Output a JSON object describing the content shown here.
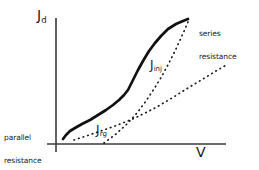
{
  "figure": {
    "kind": "schematic-jv-curve",
    "background_color": "#ffffff",
    "ink_color": "#1a1a1a"
  },
  "axes": {
    "y_label_main": "J",
    "y_label_sub": "d",
    "x_label": "V",
    "y_axis": {
      "x": 56,
      "y_top": 18,
      "y_bottom": 152
    },
    "x_axis": {
      "y": 144,
      "x_left": 47,
      "x_right": 226
    }
  },
  "annotations": {
    "parallel_resistance_line1": "parallel",
    "parallel_resistance_line2": "resistance",
    "series_resistance_line1": "series",
    "series_resistance_line2": "resistance"
  },
  "curves": {
    "solid_total": {
      "style": "solid",
      "width": 2.6,
      "label": "",
      "points": "63,139 66,135 70,131 75,128 82,124 90,120 98,115 106,110 113,105 119,100 124,95 128,90 131,84 134,78 138,70 143,61 149,51 155,43 161,36 168,29 176,24 183,21 188,19"
    },
    "dotted_jrg": {
      "style": "dotted",
      "label_main": "J",
      "label_sub": "rg",
      "width": 1.6,
      "points": "74,140 95,133 115,126 135,118 155,108 172,98 188,88 203,79 216,71 228,64"
    },
    "dotted_jinj": {
      "style": "dotted",
      "label_main": "J",
      "label_sub": "inj",
      "width": 1.6,
      "points": "104,143 116,134 127,124 137,113 146,101 154,89 162,76 169,63 175,51 180,40 185,29 188,22"
    }
  },
  "chart_data": {
    "type": "line",
    "title": "",
    "xlabel": "V",
    "ylabel": "Jd",
    "grid": false,
    "legend": "inline-annotations",
    "series": [
      {
        "name": "Jd (total dark current)",
        "style": "solid",
        "description": "S-shaped total dark current density curve rising from parallel-resistance region at low V, through recombination region, injection region, and flattening at high V due to series resistance"
      },
      {
        "name": "Jrg",
        "style": "dotted",
        "description": "recombination-generation current component, shallow slope straight line on log-like axis"
      },
      {
        "name": "Jinj",
        "style": "dotted",
        "description": "injection current component, steeper slope straight line crossing Jrg"
      }
    ],
    "annotations": [
      {
        "text": "parallel resistance",
        "region": "low-voltage, left of origin region"
      },
      {
        "text": "series resistance",
        "region": "high-voltage, upper right"
      }
    ]
  }
}
